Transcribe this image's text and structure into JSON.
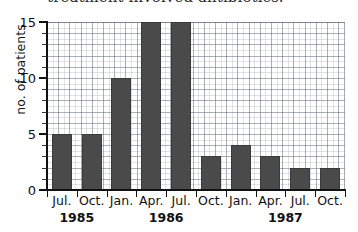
{
  "caption": {
    "text": "treatment involved antibiotics."
  },
  "chart_data": {
    "type": "bar",
    "title": "",
    "xlabel": "",
    "ylabel": "no. of patients",
    "categories": [
      "Jul.",
      "Oct.",
      "Jan.",
      "Apr.",
      "Jul.",
      "Oct.",
      "Jan.",
      "Apr.",
      "Jul.",
      "Oct."
    ],
    "values": [
      5,
      5,
      10,
      15,
      15,
      3,
      4,
      3,
      2,
      2
    ],
    "group_labels": [
      "1985",
      "1986",
      "1987"
    ],
    "ylim": [
      0,
      15
    ],
    "yticks": [
      0,
      5,
      10,
      15
    ],
    "ytick_labels": [
      "0",
      "5",
      "10",
      "15"
    ],
    "ytick_minor_step": 1,
    "grid": true,
    "legend": "none",
    "bar_color": "#4a4a4a",
    "axis_color": "#111111",
    "grid_color": "#7f8894",
    "background": "#ffffff"
  }
}
